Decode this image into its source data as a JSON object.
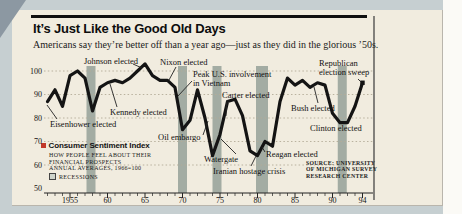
{
  "page": {
    "title": "It’s Just Like the Good Old Days",
    "subtitle": "Americans say they’re better off than a year ago—just as they did in the glorious ’50s."
  },
  "chart_data": {
    "type": "line",
    "title": "Consumer Sentiment Index",
    "x": [
      1952,
      1953,
      1954,
      1955,
      1956,
      1957,
      1958,
      1959,
      1960,
      1961,
      1962,
      1963,
      1964,
      1965,
      1966,
      1967,
      1968,
      1969,
      1970,
      1971,
      1972,
      1973,
      1974,
      1975,
      1976,
      1977,
      1978,
      1979,
      1980,
      1981,
      1982,
      1983,
      1984,
      1985,
      1986,
      1987,
      1988,
      1989,
      1990,
      1991,
      1992,
      1993,
      1994
    ],
    "values": [
      87,
      92,
      85,
      98,
      100,
      97,
      83,
      93,
      95,
      96,
      95,
      97,
      100,
      103,
      98,
      96,
      96,
      93,
      75,
      79,
      92,
      80,
      64,
      73,
      87,
      88,
      81,
      66,
      64,
      70,
      68,
      87,
      97,
      94,
      96,
      93,
      95,
      94,
      82,
      78,
      78,
      85,
      95
    ],
    "ylim": [
      50,
      105
    ],
    "yticks": [
      100,
      90,
      80,
      70,
      60,
      50
    ],
    "xticks": [
      {
        "year": 1955,
        "label": "1955"
      },
      {
        "year": 1960,
        "label": "60"
      },
      {
        "year": 1965,
        "label": "65"
      },
      {
        "year": 1970,
        "label": "70"
      },
      {
        "year": 1975,
        "label": "75"
      },
      {
        "year": 1980,
        "label": "80"
      },
      {
        "year": 1985,
        "label": "85"
      },
      {
        "year": 1990,
        "label": "90"
      },
      {
        "year": 1994,
        "label": "94"
      }
    ],
    "recessions": [
      [
        1957.2,
        1958.4
      ],
      [
        1969.4,
        1970.6
      ],
      [
        1974.0,
        1975.2
      ],
      [
        1979.8,
        1981.4
      ],
      [
        1990.7,
        1991.9
      ]
    ],
    "grid": "dotted-horizontal",
    "annotations": [
      {
        "id": "eisenhower-elected",
        "lines": [
          "Eisenhower elected"
        ],
        "x": 50,
        "y": 120,
        "leader": [
          57,
          119,
          47,
          105
        ]
      },
      {
        "id": "johnson-elected",
        "lines": [
          "Johnson elected"
        ],
        "x": 84,
        "y": 57,
        "leader": [
          133,
          64,
          142,
          68
        ]
      },
      {
        "id": "nixon-elected",
        "lines": [
          "Nixon elected"
        ],
        "x": 160,
        "y": 58,
        "leader": [
          176,
          67,
          169,
          80
        ]
      },
      {
        "id": "kennedy-elected",
        "lines": [
          "Kennedy elected"
        ],
        "x": 110,
        "y": 108,
        "leader": [
          117,
          107,
          110,
          84
        ]
      },
      {
        "id": "peak-us-involvement-in-vietnam",
        "lines": [
          "Peak U.S. involvement",
          "in Vietnam"
        ],
        "x": 193,
        "y": 70,
        "leader": [
          192,
          81,
          178,
          96
        ]
      },
      {
        "id": "carter-elected",
        "lines": [
          "Carter elected"
        ],
        "x": 222,
        "y": 91,
        "leader": [
          227,
          100,
          226,
          116
        ]
      },
      {
        "id": "oil-embargo",
        "lines": [
          "Oil embargo"
        ],
        "x": 158,
        "y": 133,
        "leader": [
          203,
          135,
          208,
          121
        ]
      },
      {
        "id": "watergate",
        "lines": [
          "Watergate"
        ],
        "x": 204,
        "y": 155,
        "leader": [
          236,
          154,
          221,
          139
        ]
      },
      {
        "id": "iranian-hostage-crisis",
        "lines": [
          "Iranian hostage crisis"
        ],
        "x": 213,
        "y": 167,
        "leader": [
          251,
          166,
          256,
          156
        ]
      },
      {
        "id": "reagan-elected",
        "lines": [
          "Reagan elected"
        ],
        "x": 266,
        "y": 150,
        "leader": [
          265,
          152,
          262,
          147
        ]
      },
      {
        "id": "bush-elected",
        "lines": [
          "Bush elected"
        ],
        "x": 291,
        "y": 104,
        "leader": [
          318,
          103,
          314,
          87
        ]
      },
      {
        "id": "clinton-elected",
        "lines": [
          "Clinton elected"
        ],
        "x": 310,
        "y": 124
      },
      {
        "id": "republican-election-sweep",
        "lines": [
          "Republican",
          "election sweep"
        ],
        "x": 319,
        "y": 59,
        "leader": [
          358,
          79,
          361,
          82
        ]
      }
    ],
    "legend": {
      "title": "Consumer Sentiment Index",
      "lines": [
        "HOW PEOPLE FEEL ABOUT THEIR",
        "FINANCIAL PROSPECTS",
        "ANNUAL AVERAGES, 1966=100"
      ],
      "recessions_label": "RECESSIONS"
    },
    "source": [
      "SOURCE: UNIVERSITY",
      "OF MICHIGAN SURVEY",
      "RESEARCH CENTER"
    ],
    "colors": {
      "line": "#141414",
      "recession": "#a3aca3",
      "accent_red": "#c2392b",
      "card_bg": "#f1ecdf",
      "page_bg": "#c6cfd1",
      "gridline": "#b3ab97"
    }
  }
}
